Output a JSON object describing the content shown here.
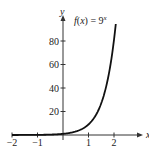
{
  "chart_data": {
    "type": "line",
    "title": "",
    "function_label": "f(x) = 9^x",
    "function_label_parts": {
      "lhs": "f(x) = 9",
      "exp": "x"
    },
    "xlabel": "x",
    "ylabel": "y",
    "xlim": [
      -2,
      2.3
    ],
    "ylim": [
      0,
      100
    ],
    "x_ticks": [
      -2,
      -1,
      1,
      2
    ],
    "x_tick_labels": [
      "−2",
      "−1",
      "1",
      "2"
    ],
    "y_ticks": [
      20,
      40,
      60,
      80
    ],
    "y_tick_labels": [
      "20",
      "40",
      "60",
      "80"
    ],
    "grid": false,
    "legend": "none",
    "series": [
      {
        "name": "f(x) = 9^x",
        "x": [
          -2,
          -1.5,
          -1,
          -0.5,
          0,
          0.25,
          0.5,
          0.75,
          1,
          1.25,
          1.5,
          1.75,
          2,
          2.07
        ],
        "y": [
          0.012,
          0.037,
          0.111,
          0.333,
          1,
          1.73,
          3,
          5.2,
          9,
          15.6,
          27,
          46.8,
          81,
          95
        ]
      }
    ]
  },
  "axes": {
    "x_axis_label": "x",
    "y_axis_label": "y"
  }
}
